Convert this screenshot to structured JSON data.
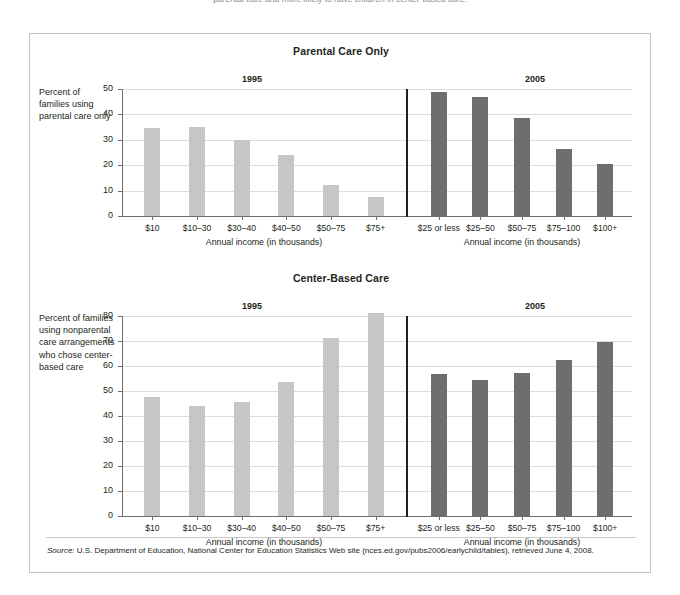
{
  "top_caption": "parental care and more likely to have children in center-based care.",
  "figure": {
    "source_prefix": "Source:",
    "source_text": " U.S. Department of Education, National Center for Education Statistics Web site (nces.ed.gov/pubs2006/earlychild/tables), retrieved June 4, 2008."
  },
  "chart_data": [
    {
      "type": "bar",
      "title": "Parental Care Only",
      "ylabel": "Percent of families using parental care only",
      "xlabel": "Annual income (in thousands)",
      "ylim": [
        0,
        50
      ],
      "yticks": [
        0,
        10,
        20,
        30,
        40,
        50
      ],
      "grid": true,
      "legend": "none",
      "panels": [
        {
          "name": "1995",
          "categories": [
            "$10",
            "$10–30",
            "$30–40",
            "$40–50",
            "$50–75",
            "$75+"
          ],
          "values": [
            34.5,
            35.0,
            30.0,
            24.0,
            12.3,
            7.3
          ],
          "color": "#c6c6c6"
        },
        {
          "name": "2005",
          "categories": [
            "$25 or less",
            "$25–50",
            "$50–75",
            "$75–100",
            "$100+"
          ],
          "values": [
            49.0,
            46.7,
            38.7,
            26.5,
            20.5
          ],
          "color": "#6e6e6e"
        }
      ]
    },
    {
      "type": "bar",
      "title": "Center-Based Care",
      "ylabel": "Percent of families using nonparental care arrangements who chose center-based care",
      "xlabel": "Annual income (in thousands)",
      "ylim": [
        0,
        80
      ],
      "yticks": [
        0,
        10,
        20,
        30,
        40,
        50,
        60,
        70,
        80
      ],
      "grid": true,
      "legend": "none",
      "panels": [
        {
          "name": "1995",
          "categories": [
            "$10",
            "$10–30",
            "$30–40",
            "$40–50",
            "$50–75",
            "$75+"
          ],
          "values": [
            47.8,
            44.0,
            45.8,
            53.7,
            71.2,
            81.3
          ],
          "color": "#c6c6c6"
        },
        {
          "name": "2005",
          "categories": [
            "$25 or less",
            "$25–50",
            "$50–75",
            "$75–100",
            "$100+"
          ],
          "values": [
            56.7,
            54.3,
            57.4,
            62.6,
            69.5
          ],
          "color": "#6e6e6e"
        }
      ]
    }
  ]
}
